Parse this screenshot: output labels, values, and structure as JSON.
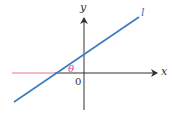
{
  "diagram": {
    "type": "coordinate-axes-with-line",
    "axes": {
      "x_label": "x",
      "y_label": "y",
      "origin_label": "0"
    },
    "line": {
      "label": "l",
      "color": "#3a7cc4"
    },
    "angle": {
      "label": "θ",
      "color": "#d9478a"
    },
    "colors": {
      "axis": "#333333",
      "negative_x_highlight": "#e07a8a",
      "line": "#3a7cc4",
      "angle_label": "#d9478a"
    }
  }
}
